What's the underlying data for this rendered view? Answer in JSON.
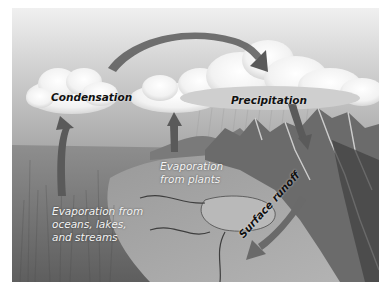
{
  "figure": {
    "style": "grayscale illustration",
    "colors": {
      "background": "#ffffff",
      "sky_top": "#e8e8e8",
      "sky_horizon": "#a9a9a9",
      "arrow": "#5a5a5a",
      "dark_label": "#111111",
      "light_label": "#f4f4f4"
    }
  },
  "labels": {
    "condensation": "Condensation",
    "precipitation": "Precipitation",
    "evaporation_plants": [
      "Evaporation",
      "from plants"
    ],
    "evaporation_oceans": [
      "Evaporation from",
      "oceans, lakes,",
      "and streams"
    ],
    "surface_runoff": "Surface runoff"
  },
  "arrows": [
    {
      "name": "evaporation-oceans-arrow",
      "from": "ground (left)",
      "to": "Condensation cloud",
      "direction": "up"
    },
    {
      "name": "evaporation-plants-arrow",
      "from": "plants",
      "to": "middle cloud",
      "direction": "up"
    },
    {
      "name": "transport-arc-arrow",
      "from": "Condensation cloud",
      "to": "Precipitation cloud",
      "direction": "arc right"
    },
    {
      "name": "precipitation-arrow",
      "from": "Precipitation cloud",
      "to": "mountains",
      "direction": "down"
    },
    {
      "name": "surface-runoff-arrow",
      "from": "mountains",
      "to": "valley lake",
      "direction": "down-left"
    }
  ],
  "scene_elements": [
    "sky",
    "clouds",
    "mountains",
    "valley",
    "river",
    "lake",
    "grassland"
  ]
}
